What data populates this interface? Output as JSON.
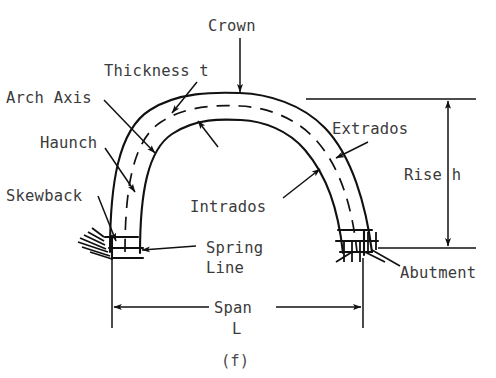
{
  "figure": {
    "caption": "(f)",
    "labels": {
      "crown": "Crown",
      "thickness": "Thickness t",
      "arch_axis": "Arch Axis",
      "haunch": "Haunch",
      "skewback": "Skewback",
      "extrados": "Extrados",
      "intrados": "Intrados",
      "spring_line_1": "Spring",
      "spring_line_2": "Line",
      "abutment": "Abutment",
      "rise": "Rise h",
      "span_1": "Span",
      "span_2": "L"
    },
    "colors": {
      "line": "#111111",
      "text": "#3b3b3b",
      "background": "#ffffff"
    }
  }
}
